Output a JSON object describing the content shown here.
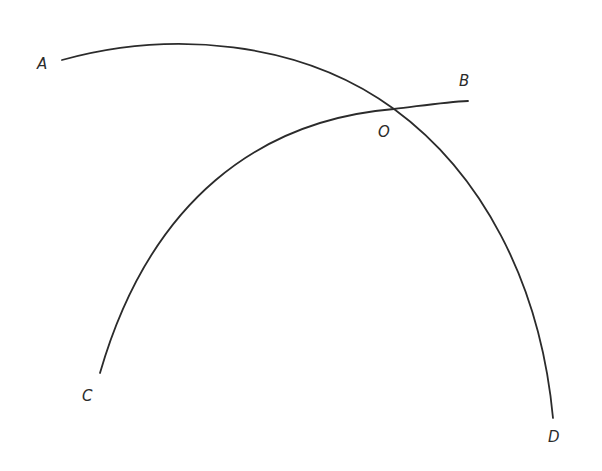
{
  "diagram": {
    "stroke_color": "#2b2b2b",
    "background": "#ffffff",
    "curves": [
      {
        "name": "arc-AD",
        "from": "A",
        "to": "D",
        "path": "M 62 60 C 170 30, 300 40, 394 109 C 480 172, 540 280, 553 418"
      },
      {
        "name": "arc-CB",
        "from": "C",
        "to": "B",
        "path": "M 100 373 C 150 200, 260 120, 394 109 C 420 106, 445 102, 468 101"
      }
    ],
    "labels": {
      "A": {
        "text": "A",
        "x": 37,
        "y": 69
      },
      "B": {
        "text": "B",
        "x": 459,
        "y": 86
      },
      "O": {
        "text": "O",
        "x": 378,
        "y": 137
      },
      "C": {
        "text": "C",
        "x": 82,
        "y": 401
      },
      "D": {
        "text": "D",
        "x": 548,
        "y": 442
      }
    },
    "intersection": {
      "label": "O",
      "x": 394,
      "y": 109
    }
  }
}
